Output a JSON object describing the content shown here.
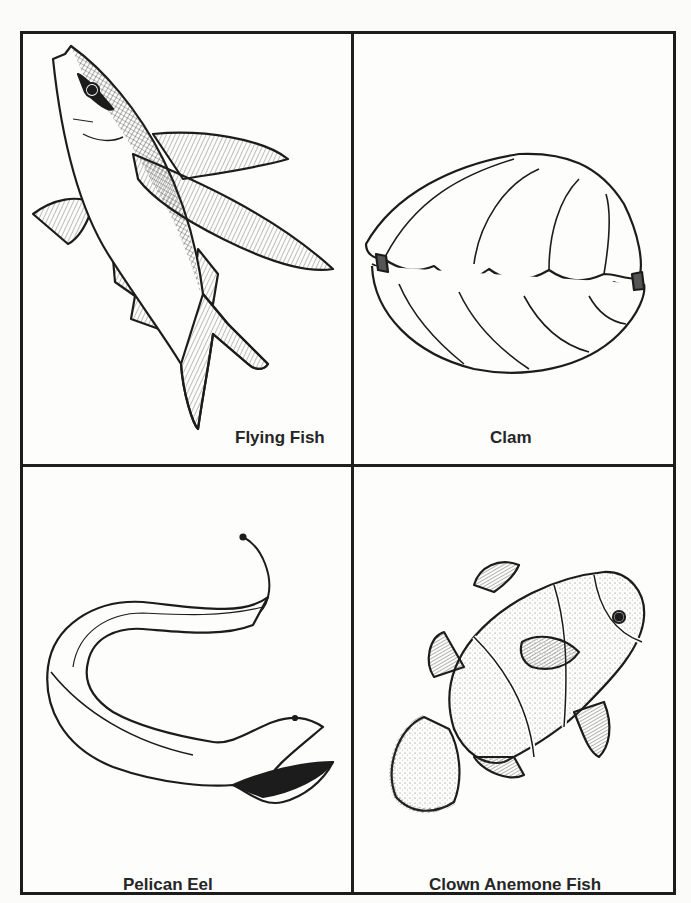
{
  "page": {
    "type": "coloring-sheet",
    "layout": "2x2 grid",
    "line_color": "#1c1c1c",
    "background": "#fdfdfc"
  },
  "cells": [
    {
      "position": "top-left",
      "label": "Flying Fish",
      "illustration": "flying-fish"
    },
    {
      "position": "top-right",
      "label": "Clam",
      "illustration": "clam"
    },
    {
      "position": "bottom-left",
      "label": "Pelican Eel",
      "illustration": "pelican-eel"
    },
    {
      "position": "bottom-right",
      "label": "Clown Anemone Fish",
      "illustration": "clown-anemone-fish"
    }
  ]
}
